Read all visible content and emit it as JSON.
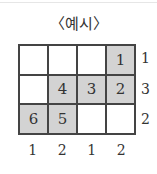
{
  "title": "〈예시〉",
  "grid": {
    "rows": [
      [
        {
          "value": "",
          "shaded": false
        },
        {
          "value": "",
          "shaded": false
        },
        {
          "value": "",
          "shaded": false
        },
        {
          "value": "1",
          "shaded": true
        }
      ],
      [
        {
          "value": "",
          "shaded": false
        },
        {
          "value": "4",
          "shaded": true
        },
        {
          "value": "3",
          "shaded": true
        },
        {
          "value": "2",
          "shaded": true
        }
      ],
      [
        {
          "value": "6",
          "shaded": true
        },
        {
          "value": "5",
          "shaded": true
        },
        {
          "value": "",
          "shaded": false
        },
        {
          "value": "",
          "shaded": false
        }
      ]
    ],
    "row_labels": [
      "1",
      "3",
      "2"
    ],
    "col_labels": [
      "1",
      "2",
      "1",
      "2"
    ],
    "shade_color": "#d3d3d3"
  }
}
